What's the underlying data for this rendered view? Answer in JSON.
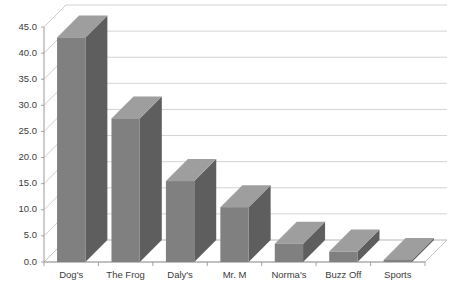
{
  "chart_data": {
    "type": "bar",
    "title": "",
    "subtitle": "",
    "xlabel": "",
    "ylabel": "",
    "categories": [
      "Dog's",
      "The Frog",
      "Daly's",
      "Mr. M",
      "Norma's",
      "Buzz Off",
      "Sports"
    ],
    "values": [
      43.0,
      27.5,
      15.5,
      10.5,
      3.5,
      2.0,
      0.4
    ],
    "series": [
      {
        "name": "Series 1",
        "values": [
          43.0,
          27.5,
          15.5,
          10.5,
          3.5,
          2.0,
          0.4
        ]
      }
    ],
    "ylim": [
      0,
      45
    ],
    "ytick_step": 5,
    "ytick_labels": [
      "0.0",
      "5.0",
      "10.0",
      "15.0",
      "20.0",
      "25.0",
      "30.0",
      "35.0",
      "40.0",
      "45.0"
    ],
    "ytick_values": [
      0,
      5,
      10,
      15,
      20,
      25,
      30,
      35,
      40,
      45
    ],
    "grid": true,
    "grid_axis": "y",
    "legend": false,
    "legend_position": "none",
    "style": "3d",
    "colors": {
      "bar_front": "#808080",
      "bar_side": "#5e5e5e",
      "bar_top": "#9e9e9e",
      "gridline": "#c8c8c8",
      "axis": "#9a9a9a",
      "text": "#3b3b3b",
      "background": "#ffffff",
      "plot_area": "#ffffff"
    }
  }
}
